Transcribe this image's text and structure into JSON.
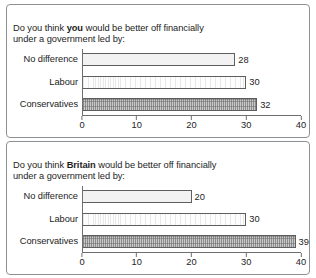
{
  "chart_data": [
    {
      "type": "bar",
      "orientation": "horizontal",
      "title_prefix": "Do you think ",
      "title_bold": "you",
      "title_suffix": " would be better off financially\nunder a government led by:",
      "title": "Do you think you would be better off financially under a government led by:",
      "categories": [
        "No difference",
        "Labour",
        "Conservatives"
      ],
      "values": [
        28,
        30,
        32
      ],
      "bar_styles": [
        "light",
        "plain",
        "hatched"
      ],
      "xlabel": "",
      "ylabel": "",
      "xlim": [
        0,
        40
      ],
      "xticks": [
        0,
        10,
        20,
        30,
        40
      ],
      "xtick_labels": [
        "0",
        "10",
        "20",
        "30",
        "40"
      ],
      "grid": false,
      "legend": false
    },
    {
      "type": "bar",
      "orientation": "horizontal",
      "title_prefix": "Do you think ",
      "title_bold": "Britain",
      "title_suffix": " would be better off financially\nunder a government led by:",
      "title": "Do you think Britain would be better off financially under a government led by:",
      "categories": [
        "No difference",
        "Labour",
        "Conservatives"
      ],
      "values": [
        20,
        30,
        39
      ],
      "bar_styles": [
        "light",
        "plain",
        "hatched"
      ],
      "xlabel": "",
      "ylabel": "",
      "xlim": [
        0,
        40
      ],
      "xticks": [
        0,
        10,
        20,
        30,
        40
      ],
      "xtick_labels": [
        "0",
        "10",
        "20",
        "30",
        "40"
      ],
      "grid": false,
      "legend": false
    }
  ],
  "colors": {
    "panel_border": "#8e9194",
    "axis": "#6d7073",
    "bar_border": "#5c5f62",
    "hatch_fill": "#c9c9c9",
    "light_fill": "#f2f2f2",
    "text": "#1d1d1d"
  }
}
